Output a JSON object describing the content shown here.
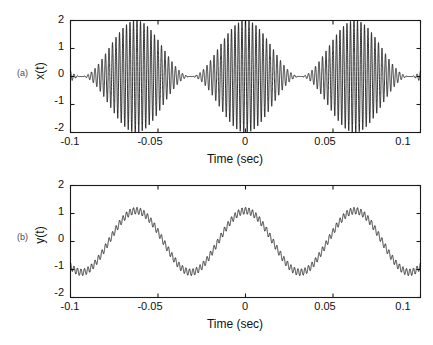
{
  "figure": {
    "background": "#ffffff",
    "trace_color": "#0d0d0d",
    "axis_color": "#1a1a1a"
  },
  "panels": [
    {
      "tag": "(a)",
      "ylabel": "x(t)",
      "xlabel": "Time (sec)",
      "yticks": [
        "2",
        "1",
        "0",
        "-1",
        "-2"
      ],
      "xticks": [
        "-0.1",
        "-0.05",
        "0",
        "0.05",
        "0.1"
      ]
    },
    {
      "tag": "(b)",
      "ylabel": "y(t)",
      "xlabel": "Time (sec)",
      "yticks": [
        "2",
        "1",
        "0",
        "-1",
        "-2"
      ],
      "xticks": [
        "-0.1",
        "-0.05",
        "0",
        "0.05",
        "0.1"
      ]
    }
  ],
  "chart_data": [
    {
      "type": "line",
      "title": "",
      "panel": "(a)",
      "xlabel": "Time (sec)",
      "ylabel": "x(t)",
      "xlim": [
        -0.1,
        0.1
      ],
      "ylim": [
        -2,
        2
      ],
      "xticks": [
        -0.1,
        -0.05,
        0,
        0.05,
        0.1
      ],
      "yticks": [
        -2,
        -1,
        0,
        1,
        2
      ],
      "grid": false,
      "legend": null,
      "description": "Amplitude-modulated carrier: a high-frequency sinusoid whose envelope is a slow sinusoid. Envelope maxima reach +2 / -2 at t = -0.0625, 0, 0.0625 sec; envelope minima approach 0 at t = -0.031, 0.031 sec.",
      "signal_model": {
        "expression": "x(t) = (1 + cos(2*pi*16*t)) * cos(2*pi*500*t)",
        "carrier_frequency_hz": 500,
        "modulation_frequency_hz": 16,
        "envelope_peak": 2.0,
        "envelope_trough": 0.0
      },
      "envelope_upper": {
        "t": [
          -0.1,
          -0.0875,
          -0.075,
          -0.0625,
          -0.05,
          -0.0375,
          -0.031,
          -0.025,
          -0.0125,
          0.0,
          0.0125,
          0.025,
          0.031,
          0.0375,
          0.05,
          0.0625,
          0.075,
          0.0875,
          0.1
        ],
        "value": [
          1.05,
          1.55,
          1.9,
          2.0,
          1.9,
          1.3,
          0.05,
          0.35,
          1.25,
          2.0,
          1.25,
          0.35,
          0.05,
          1.3,
          1.9,
          2.0,
          1.9,
          1.55,
          1.05
        ]
      },
      "envelope_lower": {
        "t": [
          -0.1,
          -0.0875,
          -0.075,
          -0.0625,
          -0.05,
          -0.0375,
          -0.031,
          -0.025,
          -0.0125,
          0.0,
          0.0125,
          0.025,
          0.031,
          0.0375,
          0.05,
          0.0625,
          0.075,
          0.0875,
          0.1
        ],
        "value": [
          -1.05,
          -1.55,
          -1.9,
          -2.0,
          -1.9,
          -1.3,
          -0.05,
          -0.35,
          -1.25,
          -2.0,
          -1.25,
          -0.35,
          -0.05,
          -1.3,
          -1.9,
          -2.0,
          -1.9,
          -1.55,
          -1.05
        ]
      }
    },
    {
      "type": "line",
      "title": "",
      "panel": "(b)",
      "xlabel": "Time (sec)",
      "ylabel": "y(t)",
      "xlim": [
        -0.1,
        0.1
      ],
      "ylim": [
        -2,
        2
      ],
      "xticks": [
        -0.1,
        -0.05,
        0,
        0.05,
        0.1
      ],
      "yticks": [
        -2,
        -1,
        0,
        1,
        2
      ],
      "grid": false,
      "legend": null,
      "description": "Low-frequency sinusoid with a small superimposed high-frequency ripple. Peaks near +1.25 at t = -0.0625, 0, 0.0625 sec; troughs near -1.2 at t = -0.031, 0.031 sec and at the plot edges.",
      "signal_model": {
        "expression": "y(t) = 1.1*cos(2*pi*16*t) + 0.12*cos(2*pi*500*t)",
        "carrier_ripple_frequency_hz": 500,
        "modulation_frequency_hz": 16,
        "ripple_amplitude": 0.12,
        "baseline_amplitude": 1.1
      },
      "baseline": {
        "t": [
          -0.1,
          -0.0875,
          -0.075,
          -0.0625,
          -0.05,
          -0.0375,
          -0.031,
          -0.025,
          -0.0125,
          0.0,
          0.0125,
          0.025,
          0.031,
          0.0375,
          0.05,
          0.0625,
          0.075,
          0.0875,
          0.1
        ],
        "value": [
          -0.95,
          -0.2,
          0.75,
          1.12,
          0.8,
          -0.15,
          -1.0,
          -0.9,
          0.25,
          1.12,
          0.25,
          -0.9,
          -1.0,
          -0.15,
          0.8,
          1.12,
          0.75,
          -0.2,
          -0.95
        ]
      }
    }
  ]
}
